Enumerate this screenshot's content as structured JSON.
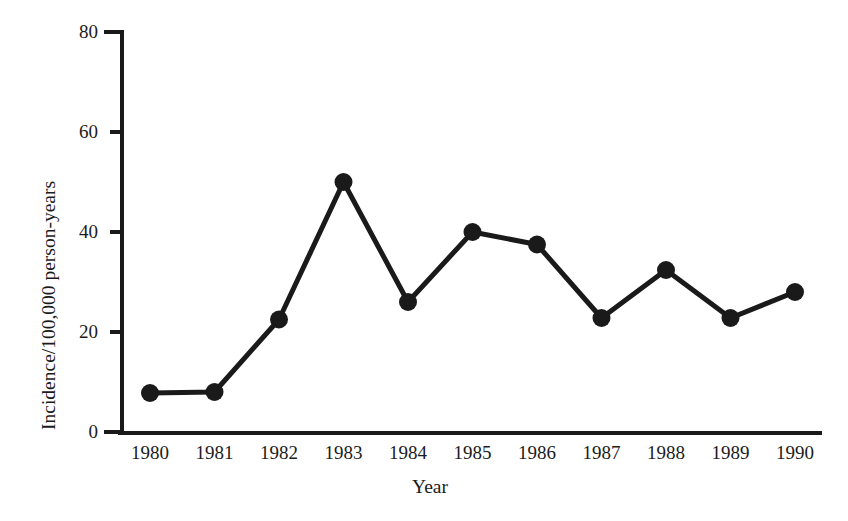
{
  "chart_data": {
    "type": "line",
    "title": "",
    "xlabel": "Year",
    "ylabel": "Incidence/100,000 person-years",
    "categories": [
      "1980",
      "1981",
      "1982",
      "1983",
      "1984",
      "1985",
      "1986",
      "1987",
      "1988",
      "1989",
      "1990"
    ],
    "values": [
      7.8,
      8.0,
      22.5,
      50.0,
      26.0,
      40.0,
      37.5,
      22.8,
      32.4,
      22.8,
      28.0
    ],
    "series": [
      {
        "name": "Incidence",
        "values": [
          7.8,
          8.0,
          22.5,
          50.0,
          26.0,
          40.0,
          37.5,
          22.8,
          32.4,
          22.8,
          28.0
        ]
      }
    ],
    "x": [
      1980,
      1981,
      1982,
      1983,
      1984,
      1985,
      1986,
      1987,
      1988,
      1989,
      1990
    ],
    "ylim": [
      0,
      80
    ],
    "xlim": [
      1979.5,
      1990.5
    ],
    "yticks": [
      0,
      20,
      40,
      60,
      80
    ],
    "ytick_labels": [
      "0",
      "20",
      "40",
      "60",
      "80"
    ],
    "xtick_labels": [
      "1980",
      "1981",
      "1982",
      "1983",
      "1984",
      "1985",
      "1986",
      "1987",
      "1988",
      "1989",
      "1990"
    ],
    "grid": false,
    "legend": "none",
    "line_color": "#1a1a1a",
    "marker_color": "#1a1a1a",
    "marker_style": "filled-circle",
    "axis_color": "#1a1a1a",
    "background_color": "#ffffff"
  },
  "axis": {
    "y_title": "Incidence/100,000 person-years",
    "x_title": "Year"
  }
}
